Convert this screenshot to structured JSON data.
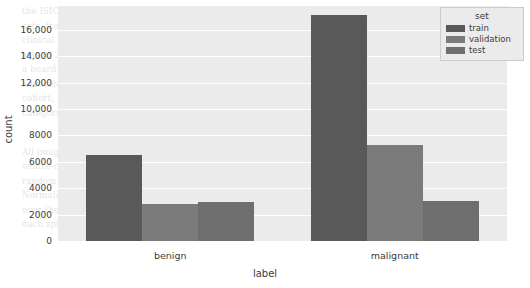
{
  "chart_data": {
    "type": "bar",
    "title": "",
    "xlabel": "label",
    "ylabel": "count",
    "categories": [
      "benign",
      "malignant"
    ],
    "series": [
      {
        "name": "train",
        "values": [
          6550,
          17100
        ],
        "color": "#595959"
      },
      {
        "name": "validation",
        "values": [
          2780,
          7300
        ],
        "color": "#7b7b7b"
      },
      {
        "name": "test",
        "values": [
          2960,
          3040
        ],
        "color": "#6e6e6e"
      }
    ],
    "legend": {
      "title": "set",
      "position": "upper right",
      "entries": [
        "train",
        "validation",
        "test"
      ]
    },
    "ylim": [
      0,
      17800
    ],
    "yticks": [
      0,
      2000,
      4000,
      6000,
      8000,
      10000,
      12000,
      14000,
      16000
    ],
    "ytick_labels": [
      "0",
      "2000",
      "4000",
      "6000",
      "8000",
      "10,000",
      "12,000",
      "14,000",
      "16,000"
    ],
    "grid": "horizontal",
    "plot_background": "#ebebeb",
    "gridline_color": "#ffffff",
    "figure_background": "#ffffff"
  },
  "background_text": {
    "lines": [
      "the ISIC archive. Images were collected and the dataset was assembled from the",
      "sets, from which we extracted a representative subset for diagnosis from",
      "clinical cases. The resulting collection is split into training, validation and test",
      "sets of 23,650, 10,080 and 6,000 images respectively. Each image was labelled by",
      "a board-certified dermatologist, and we report the agreement between the three",
      "annotators in terms of Cohen's kappa. The overall kappa was 0.74 for the whole",
      "cohort; per-class kappas were 0.81 and 0.67 for the benign and malignant",
      "categories respectively.",
      "",
      "Image pre-processing and augmentation",
      "All images were resized so that the shorter side measured 512 pixels and then",
      "centre-cropped to 448 x 448. We applied random horizontal and vertical flips,",
      "random rotations of up to 30 degrees, and colour jitter to the training split only.",
      "Normalisation used the per-channel means and standard deviations computed",
      "over the training split. The table below summarises the number of images in",
      "each split, broken down by diagnostic label."
    ],
    "heading": "Data pre-processing and augmentation"
  }
}
